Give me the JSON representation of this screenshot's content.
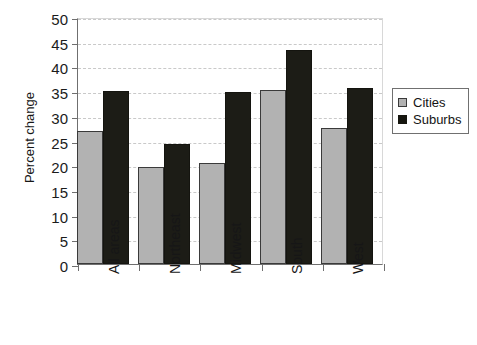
{
  "chart_data": {
    "type": "bar",
    "title": "",
    "xlabel": "",
    "ylabel": "Percent change",
    "ylim": [
      0,
      50
    ],
    "ytick_step": 5,
    "yticks": [
      "50",
      "45",
      "40",
      "35",
      "30",
      "25",
      "20",
      "15",
      "10",
      "5",
      "0"
    ],
    "grid": true,
    "legend_position": "right",
    "categories": [
      "All areas",
      "Northeast",
      "Midwest",
      "South",
      "West"
    ],
    "series": [
      {
        "name": "Cities",
        "color": "#b2b2b2",
        "values": [
          26.9,
          19.7,
          20.4,
          35.3,
          27.5
        ]
      },
      {
        "name": "Suburbs",
        "color": "#16160f",
        "values": [
          35.0,
          24.2,
          34.9,
          43.3,
          35.6
        ]
      }
    ]
  },
  "legend": {
    "items": [
      {
        "label": "Cities",
        "swatch": "cities"
      },
      {
        "label": "Suburbs",
        "swatch": "suburbs"
      }
    ]
  }
}
